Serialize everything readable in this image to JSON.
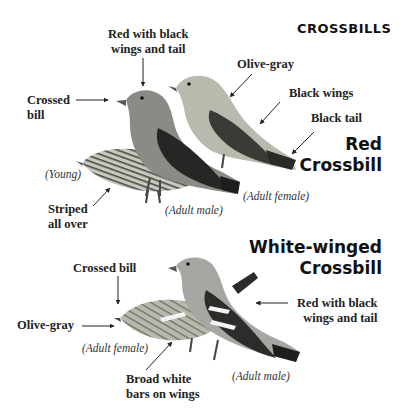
{
  "title": "CROSSBILLS",
  "species": [
    {
      "name_line1": "Red",
      "name_line2": "Crossbill",
      "annotations": [
        {
          "id": "red-with-black",
          "line1": "Red with black",
          "line2": "wings and tail"
        },
        {
          "id": "crossed-bill",
          "line1": "Crossed",
          "line2": "bill"
        },
        {
          "id": "olive-gray",
          "line1": "Olive-gray"
        },
        {
          "id": "black-wings",
          "line1": "Black wings"
        },
        {
          "id": "black-tail",
          "line1": "Black tail"
        },
        {
          "id": "striped",
          "line1": "Striped",
          "line2": "all over"
        }
      ],
      "birds": [
        {
          "label": "(Young)",
          "color": "#8a8a7e"
        },
        {
          "label": "(Adult male)",
          "color": "#7a7a7a"
        },
        {
          "label": "(Adult female)",
          "color": "#9a9a90"
        }
      ]
    },
    {
      "name_line1": "White-winged",
      "name_line2": "Crossbill",
      "annotations": [
        {
          "id": "crossed-bill",
          "line1": "Crossed bill"
        },
        {
          "id": "olive-gray",
          "line1": "Olive-gray"
        },
        {
          "id": "red-with-black",
          "line1": "Red with black",
          "line2": "wings and tail"
        },
        {
          "id": "broad-white-bars",
          "line1": "Broad white",
          "line2": "bars on wings"
        }
      ],
      "birds": [
        {
          "label": "(Adult female)",
          "color": "#8e8e84"
        },
        {
          "label": "(Adult male)",
          "color": "#a0a0a0"
        }
      ]
    }
  ]
}
